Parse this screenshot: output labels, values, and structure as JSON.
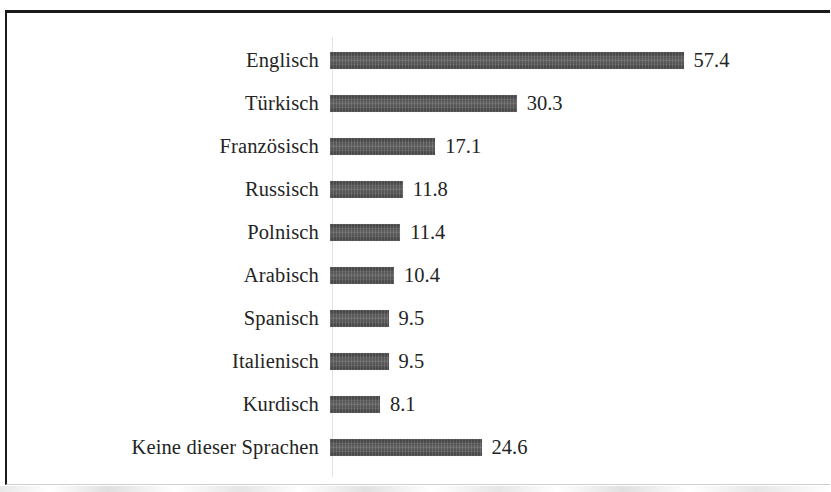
{
  "figure": {
    "kind": "horizontal-bar-chart",
    "bar_color": "#4e4e4e",
    "text_color": "#242424",
    "frame_color": "#1a1a1a",
    "background": "#ffffff"
  },
  "chart_data": {
    "type": "bar",
    "orientation": "horizontal",
    "title": "",
    "subtitle": "",
    "xlabel": "",
    "ylabel": "",
    "grid": false,
    "legend": false,
    "xlim": [
      0,
      57.4
    ],
    "categories": [
      "Englisch",
      "Türkisch",
      "Französisch",
      "Russisch",
      "Polnisch",
      "Arabisch",
      "Spanisch",
      "Italienisch",
      "Kurdisch",
      "Keine dieser Sprachen"
    ],
    "values": [
      57.4,
      30.3,
      17.1,
      11.8,
      11.4,
      10.4,
      9.5,
      9.5,
      8.1,
      24.6
    ],
    "value_labels": [
      "57.4",
      "30.3",
      "17.1",
      "11.8",
      "11.4",
      "10.4",
      "9.5",
      "9.5",
      "8.1",
      "24.6"
    ],
    "bars": [
      {
        "label": "Englisch",
        "value": 57.4,
        "value_label": "57.4"
      },
      {
        "label": "Türkisch",
        "value": 30.3,
        "value_label": "30.3"
      },
      {
        "label": "Französisch",
        "value": 17.1,
        "value_label": "17.1"
      },
      {
        "label": "Russisch",
        "value": 11.8,
        "value_label": "11.8"
      },
      {
        "label": "Polnisch",
        "value": 11.4,
        "value_label": "11.4"
      },
      {
        "label": "Arabisch",
        "value": 10.4,
        "value_label": "10.4"
      },
      {
        "label": "Spanisch",
        "value": 9.5,
        "value_label": "9.5"
      },
      {
        "label": "Italienisch",
        "value": 9.5,
        "value_label": "9.5"
      },
      {
        "label": "Kurdisch",
        "value": 8.1,
        "value_label": "8.1"
      },
      {
        "label": "Keine dieser Sprachen",
        "value": 24.6,
        "value_label": "24.6"
      }
    ]
  }
}
